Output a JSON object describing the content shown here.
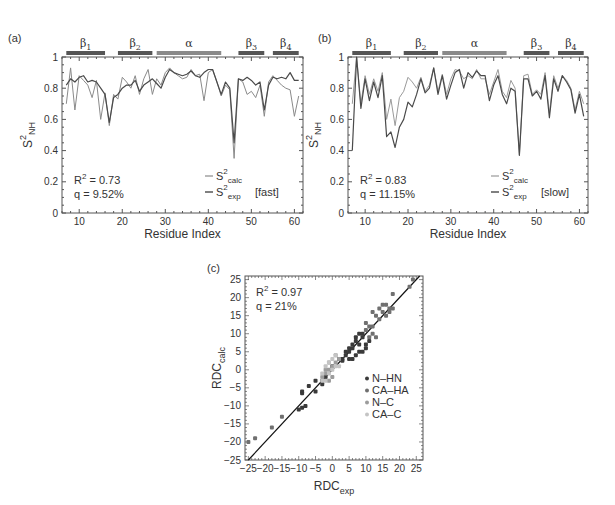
{
  "chart_data": [
    {
      "panel": "(a)",
      "type": "line",
      "xlabel": "Residue Index",
      "ylabel": "S2_NH",
      "xlim": [
        6,
        62
      ],
      "ylim": [
        0,
        1
      ],
      "xticks": [
        10,
        20,
        30,
        40,
        50,
        60
      ],
      "yticks": [
        0,
        0.2,
        0.4,
        0.6,
        0.8,
        1
      ],
      "secondary_structure": [
        {
          "label": "β1",
          "start": 7,
          "end": 16
        },
        {
          "label": "β2",
          "start": 19,
          "end": 27
        },
        {
          "label": "α",
          "start": 28,
          "end": 43
        },
        {
          "label": "β3",
          "start": 47,
          "end": 53
        },
        {
          "label": "β4",
          "start": 55,
          "end": 61
        }
      ],
      "annotations": [
        "R² = 0.73",
        "q = 9.52%"
      ],
      "legend": [
        "S²calc",
        "S²exp [fast]"
      ],
      "x": [
        7,
        8,
        9,
        10,
        11,
        12,
        13,
        14,
        15,
        16,
        17,
        18,
        19,
        20,
        21,
        22,
        23,
        24,
        25,
        26,
        27,
        28,
        29,
        30,
        31,
        32,
        33,
        34,
        35,
        36,
        37,
        38,
        39,
        40,
        41,
        42,
        43,
        44,
        45,
        46,
        47,
        48,
        49,
        50,
        51,
        52,
        53,
        54,
        55,
        56,
        57,
        58,
        59,
        60,
        61
      ],
      "series": [
        {
          "name": "S²calc",
          "color": "#8a8a8a",
          "values": [
            0.7,
            0.93,
            0.66,
            0.88,
            0.85,
            0.82,
            0.74,
            0.85,
            0.6,
            0.77,
            0.56,
            0.76,
            0.73,
            0.87,
            0.84,
            0.8,
            0.88,
            0.76,
            0.86,
            0.92,
            0.76,
            0.86,
            0.82,
            0.9,
            0.93,
            0.9,
            0.88,
            0.86,
            0.87,
            0.92,
            0.88,
            0.89,
            0.72,
            0.9,
            0.92,
            0.84,
            0.75,
            0.82,
            0.79,
            0.35,
            0.86,
            0.84,
            0.76,
            0.78,
            0.74,
            0.82,
            0.62,
            0.84,
            0.88,
            0.85,
            0.82,
            0.8,
            0.79,
            0.62,
            0.75
          ]
        },
        {
          "name": "S²exp [fast]",
          "color": "#4a4a4a",
          "values": [
            0.82,
            0.86,
            0.84,
            0.87,
            0.88,
            0.84,
            0.85,
            0.84,
            0.8,
            0.76,
            0.58,
            0.74,
            0.76,
            0.8,
            0.82,
            0.82,
            0.85,
            0.78,
            0.82,
            0.84,
            0.86,
            0.83,
            0.8,
            0.87,
            0.92,
            0.9,
            0.89,
            0.88,
            0.89,
            0.91,
            0.88,
            0.87,
            0.9,
            0.92,
            0.92,
            0.84,
            0.76,
            0.84,
            0.8,
            0.45,
            0.86,
            0.85,
            0.87,
            0.85,
            0.82,
            0.84,
            0.66,
            0.82,
            0.87,
            0.86,
            0.87,
            0.86,
            0.9,
            0.85,
            0.85
          ]
        }
      ]
    },
    {
      "panel": "(b)",
      "type": "line",
      "xlabel": "Residue Index",
      "ylabel": "S2_NH",
      "xlim": [
        6,
        62
      ],
      "ylim": [
        0,
        1
      ],
      "xticks": [
        10,
        20,
        30,
        40,
        50,
        60
      ],
      "yticks": [
        0,
        0.2,
        0.4,
        0.6,
        0.8,
        1
      ],
      "secondary_structure": [
        {
          "label": "β1",
          "start": 7,
          "end": 16
        },
        {
          "label": "β2",
          "start": 19,
          "end": 27
        },
        {
          "label": "α",
          "start": 28,
          "end": 43
        },
        {
          "label": "β3",
          "start": 47,
          "end": 53
        },
        {
          "label": "β4",
          "start": 55,
          "end": 61
        }
      ],
      "annotations": [
        "R² = 0.83",
        "q = 11.15%"
      ],
      "legend": [
        "S²calc",
        "S²exp [slow]"
      ],
      "x": [
        7,
        8,
        9,
        10,
        11,
        12,
        13,
        14,
        15,
        16,
        17,
        18,
        19,
        20,
        21,
        22,
        23,
        24,
        25,
        26,
        27,
        28,
        29,
        30,
        31,
        32,
        33,
        34,
        35,
        36,
        37,
        38,
        39,
        40,
        41,
        42,
        43,
        44,
        45,
        46,
        47,
        48,
        49,
        50,
        51,
        52,
        53,
        54,
        55,
        56,
        57,
        58,
        59,
        60,
        61
      ],
      "series": [
        {
          "name": "S²calc",
          "color": "#9a9a9a",
          "values": [
            0.7,
            1.0,
            0.7,
            0.88,
            0.76,
            0.86,
            0.78,
            0.9,
            0.6,
            0.73,
            0.56,
            0.74,
            0.78,
            0.87,
            0.84,
            0.8,
            0.87,
            0.78,
            0.82,
            0.93,
            0.78,
            0.89,
            0.76,
            0.86,
            0.92,
            0.91,
            0.86,
            0.88,
            0.86,
            0.92,
            0.86,
            0.86,
            0.76,
            0.84,
            0.92,
            0.78,
            0.74,
            0.85,
            0.8,
            0.37,
            0.88,
            0.89,
            0.76,
            0.79,
            0.76,
            0.9,
            0.64,
            0.88,
            0.8,
            0.88,
            0.85,
            0.8,
            0.66,
            0.78,
            0.7
          ]
        },
        {
          "name": "S²exp [slow]",
          "color": "#4a4a4a",
          "values": [
            0.4,
            1.0,
            0.67,
            0.86,
            0.72,
            0.84,
            0.74,
            0.88,
            0.49,
            0.52,
            0.42,
            0.55,
            0.6,
            0.71,
            0.68,
            0.76,
            0.86,
            0.77,
            0.8,
            0.93,
            0.76,
            0.88,
            0.73,
            0.82,
            0.9,
            0.92,
            0.8,
            0.9,
            0.87,
            0.91,
            0.88,
            0.88,
            0.72,
            0.82,
            0.88,
            0.76,
            0.7,
            0.8,
            0.78,
            0.37,
            0.86,
            0.86,
            0.75,
            0.78,
            0.73,
            0.88,
            0.61,
            0.86,
            0.78,
            0.88,
            0.84,
            0.79,
            0.64,
            0.76,
            0.62
          ]
        }
      ]
    },
    {
      "panel": "(c)",
      "type": "scatter",
      "xlabel": "RDC_exp",
      "ylabel": "RDC_calc",
      "xlim": [
        -26,
        27
      ],
      "ylim": [
        -25,
        26
      ],
      "xticks": [
        -25,
        -20,
        -15,
        -10,
        -5,
        0,
        5,
        10,
        15,
        20,
        25
      ],
      "yticks": [
        -25,
        -20,
        -15,
        -10,
        -5,
        0,
        5,
        10,
        15,
        20,
        25
      ],
      "annotations": [
        "R² = 0.97",
        "q = 21%"
      ],
      "legend": [
        "N–HN",
        "CA–HA",
        "N–C",
        "CA–C"
      ],
      "fit_line": {
        "slope": 1,
        "intercept": 0
      },
      "series": [
        {
          "name": "N–HN",
          "color": "#3a3a3a",
          "points": [
            [
              -9,
              -6
            ],
            [
              -9,
              -6.5
            ],
            [
              -7,
              -4.5
            ],
            [
              -5,
              -3
            ],
            [
              -5,
              -6
            ],
            [
              -3,
              -4
            ],
            [
              -10,
              -11
            ],
            [
              -9,
              -10.5
            ],
            [
              -8,
              -10
            ],
            [
              -3,
              -3
            ],
            [
              -2,
              -2
            ],
            [
              0,
              1
            ],
            [
              2,
              3
            ],
            [
              3,
              3
            ],
            [
              4,
              4
            ],
            [
              5,
              5
            ],
            [
              5,
              6
            ],
            [
              6,
              7
            ],
            [
              6,
              6
            ],
            [
              7,
              8
            ],
            [
              7,
              9
            ],
            [
              8,
              10
            ],
            [
              8,
              7
            ],
            [
              9,
              9
            ],
            [
              9,
              10
            ],
            [
              10,
              6
            ],
            [
              6,
              3
            ],
            [
              7,
              4
            ],
            [
              8,
              5
            ],
            [
              9,
              5
            ],
            [
              5,
              3
            ],
            [
              4,
              5
            ],
            [
              3,
              2.5
            ],
            [
              10,
              7
            ],
            [
              11,
              8
            ]
          ]
        },
        {
          "name": "CA–HA",
          "color": "#707070",
          "points": [
            [
              -25,
              -20
            ],
            [
              -23,
              -19
            ],
            [
              -15,
              -13
            ],
            [
              -18,
              -16
            ],
            [
              10,
              11
            ],
            [
              11,
              12
            ],
            [
              12,
              10
            ],
            [
              13,
              9
            ],
            [
              14,
              14
            ],
            [
              15,
              16
            ],
            [
              15,
              18
            ],
            [
              16,
              18
            ],
            [
              17,
              17
            ],
            [
              17,
              16
            ],
            [
              18,
              17
            ],
            [
              16,
              15
            ],
            [
              18,
              21
            ],
            [
              14,
              17
            ],
            [
              13,
              15
            ],
            [
              12,
              12
            ],
            [
              11,
              9
            ],
            [
              23,
              23
            ],
            [
              24,
              25
            ],
            [
              10,
              13
            ],
            [
              12,
              16
            ]
          ]
        },
        {
          "name": "N–C",
          "color": "#9c9c9c",
          "points": [
            [
              -2,
              -1
            ],
            [
              -1,
              0
            ],
            [
              0,
              1
            ],
            [
              1,
              2
            ],
            [
              -3,
              -2
            ],
            [
              -1,
              -3
            ],
            [
              0,
              -2
            ],
            [
              2,
              3
            ],
            [
              -2,
              0
            ],
            [
              -1,
              2
            ],
            [
              1,
              4
            ]
          ]
        },
        {
          "name": "CA–C",
          "color": "#c4c4c4",
          "points": [
            [
              -3,
              -1
            ],
            [
              -2,
              1
            ],
            [
              -1,
              -1
            ],
            [
              0,
              0
            ],
            [
              1,
              1
            ],
            [
              -2,
              -3
            ],
            [
              0,
              3
            ],
            [
              1,
              4
            ],
            [
              -1,
              2
            ],
            [
              2,
              1
            ],
            [
              -3,
              -3
            ]
          ]
        }
      ]
    }
  ],
  "panels": {
    "a": {
      "label": "(a)",
      "r2": "R",
      "r2_val": " = 0.73",
      "q": "q = 9.52%",
      "legend_calc": "S",
      "legend_exp": "S",
      "calc_sub": "calc",
      "exp_sub": "exp",
      "exp_tag": "[fast]"
    },
    "b": {
      "label": "(b)",
      "r2": "R",
      "r2_val": " = 0.83",
      "q": "q = 11.15%",
      "legend_calc": "S",
      "legend_exp": "S",
      "calc_sub": "calc",
      "exp_sub": "exp",
      "exp_tag": "[slow]"
    },
    "c": {
      "label": "(c)",
      "r2": "R",
      "r2_val": " = 0.97",
      "q": "q = 21%"
    }
  },
  "axes": {
    "xlabel": "Residue Index",
    "ylabel_main": "S",
    "ylabel_sup": "2",
    "ylabel_sub": "NH",
    "rdc_x": "RDC",
    "rdc_x_sub": "exp",
    "rdc_y": "RDC",
    "rdc_y_sub": "calc"
  }
}
